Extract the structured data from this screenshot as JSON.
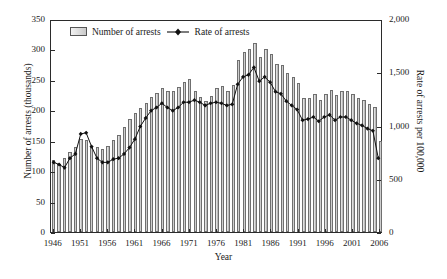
{
  "chart_data": {
    "type": "bar",
    "title": "",
    "xlabel": "Year",
    "ylabel": "Number of arrests (thousands)",
    "ylabel_right": "Rate of arrests per 100,000",
    "grid": false,
    "legend_position": "top-left-inside",
    "ylim": [
      0,
      350
    ],
    "ylim_right": [
      0,
      2000
    ],
    "yticks": [
      0,
      50,
      100,
      150,
      200,
      250,
      300,
      350
    ],
    "ytick_labels": [
      "0",
      "50",
      "100",
      "150",
      "200",
      "250",
      "300",
      "350"
    ],
    "yticks_right": [
      0,
      500,
      1000,
      1500,
      2000
    ],
    "ytick_labels_right": [
      "0",
      "500",
      "1,000",
      "1,500",
      "2,000"
    ],
    "xticks": [
      1946,
      1951,
      1956,
      1961,
      1966,
      1971,
      1976,
      1981,
      1986,
      1991,
      1996,
      2001,
      2006
    ],
    "xtick_labels": [
      "1946",
      "1951",
      "1956",
      "1961",
      "1966",
      "1971",
      "1976",
      "1981",
      "1986",
      "1991",
      "1996",
      "2001",
      "2006"
    ],
    "categories": [
      1946,
      1947,
      1948,
      1949,
      1950,
      1951,
      1952,
      1953,
      1954,
      1955,
      1956,
      1957,
      1958,
      1959,
      1960,
      1961,
      1962,
      1963,
      1964,
      1965,
      1966,
      1967,
      1968,
      1969,
      1970,
      1971,
      1972,
      1973,
      1974,
      1975,
      1976,
      1977,
      1978,
      1979,
      1980,
      1981,
      1982,
      1983,
      1984,
      1985,
      1986,
      1987,
      1988,
      1989,
      1990,
      1991,
      1992,
      1993,
      1994,
      1995,
      1996,
      1997,
      1998,
      1999,
      2000,
      2001,
      2002,
      2003,
      2004,
      2005,
      2006
    ],
    "series": [
      {
        "name": "Number of arrests",
        "unit": "thousands",
        "axis": "left",
        "type": "bar",
        "color": "#c9c9c9",
        "values": [
          118,
          112,
          122,
          131,
          140,
          153,
          152,
          142,
          139,
          137,
          141,
          152,
          160,
          172,
          185,
          196,
          203,
          212,
          222,
          229,
          236,
          232,
          231,
          238,
          246,
          252,
          231,
          222,
          216,
          224,
          236,
          240,
          232,
          241,
          283,
          296,
          300,
          311,
          288,
          300,
          292,
          276,
          275,
          262,
          255,
          245,
          220,
          221,
          226,
          217,
          226,
          233,
          225,
          231,
          232,
          226,
          221,
          217,
          210,
          205,
          150
        ]
      },
      {
        "name": "Rate of arrests",
        "unit": "per 100,000",
        "axis": "right",
        "type": "line",
        "color": "#111111",
        "marker": "diamond",
        "values": [
          660,
          640,
          610,
          700,
          740,
          930,
          940,
          810,
          700,
          660,
          660,
          690,
          700,
          740,
          800,
          880,
          1000,
          1080,
          1150,
          1180,
          1220,
          1180,
          1150,
          1180,
          1230,
          1230,
          1250,
          1230,
          1200,
          1220,
          1230,
          1220,
          1200,
          1210,
          1400,
          1470,
          1490,
          1560,
          1430,
          1470,
          1420,
          1330,
          1310,
          1240,
          1200,
          1160,
          1060,
          1070,
          1090,
          1050,
          1090,
          1110,
          1060,
          1090,
          1090,
          1060,
          1030,
          1010,
          980,
          960,
          700
        ]
      }
    ],
    "legend": [
      {
        "label": "Number of arrests",
        "marker": "bar-swatch"
      },
      {
        "label": "Rate of arrests",
        "marker": "line-diamond"
      }
    ]
  }
}
